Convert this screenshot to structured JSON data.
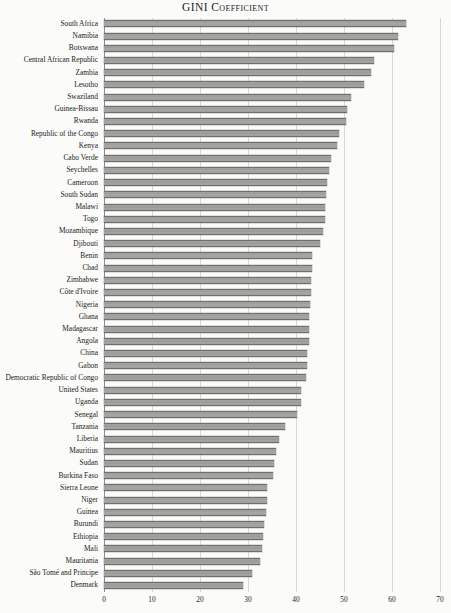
{
  "chart_data": {
    "type": "bar",
    "orientation": "horizontal",
    "title": "GINI Coefficient",
    "xlabel": "",
    "ylabel": "",
    "xlim": [
      0,
      70
    ],
    "xticks": [
      0,
      10,
      20,
      30,
      40,
      50,
      60,
      70
    ],
    "grid": true,
    "legend": null,
    "bar_color": "#9d9d9b",
    "bar_edge_color": "#6f6f6f",
    "background_color": "#fbfbf9",
    "categories": [
      "South Africa",
      "Namibia",
      "Botswana",
      "Central African Republic",
      "Zambia",
      "Lesotho",
      "Swaziland",
      "Guinea-Bissau",
      "Rwanda",
      "Republic of the Congo",
      "Kenya",
      "Cabo Verde",
      "Seychelles",
      "Cameroon",
      "South Sudan",
      "Malawi",
      "Togo",
      "Mozambique",
      "Djibouti",
      "Benin",
      "Chad",
      "Zimbabwe",
      "Côte d'Ivoire",
      "Nigeria",
      "Ghana",
      "Madagascar",
      "Angola",
      "China",
      "Gabon",
      "Democratic Republic of Congo",
      "United States",
      "Uganda",
      "Senegal",
      "Tanzania",
      "Liberia",
      "Mauritius",
      "Sudan",
      "Burkina Faso",
      "Sierra Leone",
      "Niger",
      "Guinea",
      "Burundi",
      "Ethiopia",
      "Mali",
      "Mauritania",
      "São Tomé and Principe",
      "Denmark"
    ],
    "values": [
      63.0,
      61.3,
      60.5,
      56.2,
      55.6,
      54.2,
      51.5,
      50.7,
      50.4,
      48.9,
      48.5,
      47.2,
      46.8,
      46.5,
      46.3,
      46.1,
      46.0,
      45.6,
      45.1,
      43.4,
      43.3,
      43.2,
      43.2,
      43.0,
      42.8,
      42.7,
      42.7,
      42.2,
      42.2,
      42.1,
      41.1,
      41.0,
      40.3,
      37.8,
      36.5,
      35.9,
      35.4,
      35.3,
      34.0,
      34.0,
      33.7,
      33.3,
      33.2,
      33.0,
      32.6,
      30.8,
      29.0
    ]
  },
  "xtick_labels": [
    "0",
    "10",
    "20",
    "30",
    "40",
    "50",
    "60",
    "70"
  ]
}
